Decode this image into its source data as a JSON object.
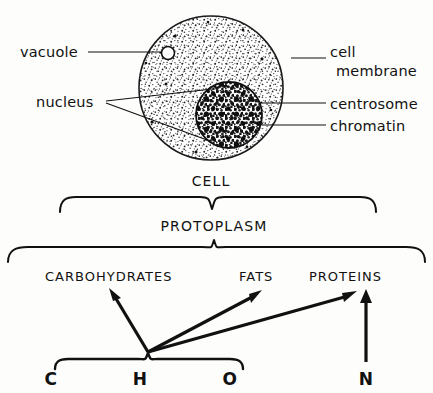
{
  "diagram": {
    "title_caption": "CELL",
    "cell_labels": {
      "vacuole": "vacuole",
      "nucleus": "nucleus",
      "cell_membrane_line1": "cell",
      "cell_membrane_line2": "membrane",
      "centrosome": "centrosome",
      "chromatin": "chromatin"
    },
    "levels": {
      "protoplasm": "PROTOPLASM",
      "compounds": [
        "CARBOHYDRATES",
        "FATS",
        "PROTEINS"
      ],
      "elements": [
        "C",
        "H",
        "O",
        "N"
      ]
    },
    "colors": {
      "ink": "#111111",
      "paper": "#fdfdfb",
      "stipple": "#2a2a2a"
    }
  }
}
